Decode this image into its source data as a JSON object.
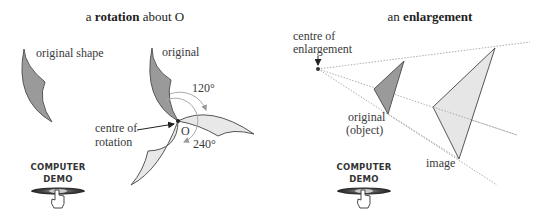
{
  "rotation_panel": {
    "title_prefix": "a ",
    "title_bold": "rotation",
    "title_suffix": " about O",
    "label_original_shape": "original shape",
    "label_original": "original",
    "label_centre_line1": "centre of",
    "label_centre_line2": "rotation",
    "label_O": "O",
    "angle_1": "120°",
    "angle_2": "240°"
  },
  "enlargement_panel": {
    "title_prefix": "an ",
    "title_bold": "enlargement",
    "label_centre_line1": "centre of",
    "label_centre_line2": "enlargement",
    "label_original_line1": "original",
    "label_original_line2": "(object)",
    "label_image": "image"
  },
  "demo_buttons": [
    {
      "line1": "COMPUTER",
      "line2": "DEMO",
      "icon": "pointing-hand-icon"
    },
    {
      "line1": "COMPUTER",
      "line2": "DEMO",
      "icon": "pointing-hand-icon"
    }
  ],
  "colors": {
    "original_fill": "#9a9a9a",
    "image_fill": "#e6e6e6",
    "outline": "#555555"
  }
}
